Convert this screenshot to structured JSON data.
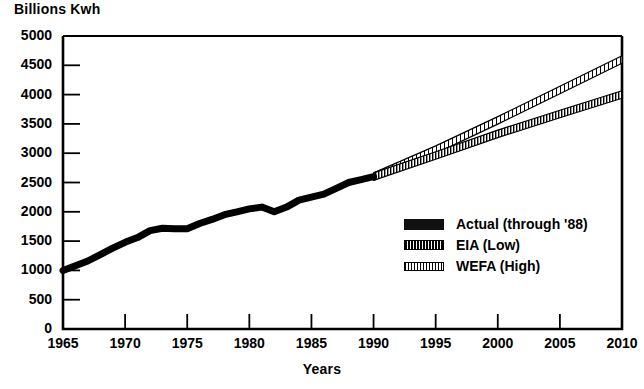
{
  "chart_data": {
    "type": "line",
    "title": "",
    "ylabel": "Billions Kwh",
    "xlabel": "Years",
    "xlim": [
      1965,
      2010
    ],
    "ylim": [
      0,
      5000
    ],
    "grid": false,
    "legend_position": "inside-lower-right",
    "xticks": [
      "1965",
      "1970",
      "1975",
      "1980",
      "1985",
      "1990",
      "1995",
      "2000",
      "2005",
      "2010"
    ],
    "yticks": [
      "0",
      "500",
      "1000",
      "1500",
      "2000",
      "2500",
      "3000",
      "3500",
      "4000",
      "4500",
      "5000"
    ],
    "series": [
      {
        "name": "Actual (through '88)",
        "style": "solid-thick-black",
        "x": [
          1965,
          1966,
          1967,
          1968,
          1969,
          1970,
          1971,
          1972,
          1973,
          1974,
          1975,
          1976,
          1977,
          1978,
          1979,
          1980,
          1981,
          1982,
          1983,
          1984,
          1985,
          1986,
          1987,
          1988,
          1989,
          1990
        ],
        "values": [
          1000,
          1080,
          1160,
          1270,
          1380,
          1480,
          1560,
          1680,
          1720,
          1710,
          1710,
          1800,
          1870,
          1950,
          2000,
          2050,
          2080,
          2000,
          2080,
          2200,
          2250,
          2300,
          2400,
          2500,
          2550,
          2600
        ]
      },
      {
        "name": "EIA (Low)",
        "style": "dense-vertical-hatch-band",
        "x": [
          1990,
          1995,
          2000,
          2005,
          2010
        ],
        "values": [
          2600,
          2960,
          3330,
          3670,
          4000
        ]
      },
      {
        "name": "WEFA (High)",
        "style": "fine-hatch-band",
        "x": [
          1990,
          1995,
          2000,
          2005,
          2010
        ],
        "values": [
          2600,
          3060,
          3560,
          4080,
          4600
        ]
      }
    ]
  },
  "legend": {
    "items": [
      {
        "label": "Actual (through '88)",
        "swatch": "solid"
      },
      {
        "label": "EIA (Low)",
        "swatch": "hatch-dense"
      },
      {
        "label": "WEFA (High)",
        "swatch": "hatch-fine"
      }
    ]
  },
  "colors": {
    "ink": "#000000",
    "background": "#ffffff"
  }
}
